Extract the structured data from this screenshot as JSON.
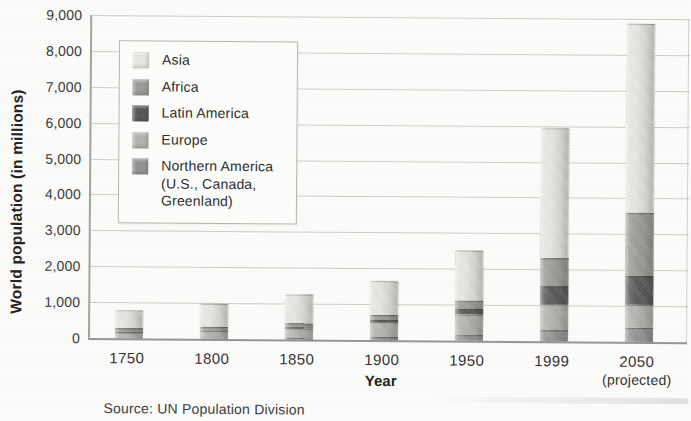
{
  "page": {
    "background": "#fbfbf9"
  },
  "chart_data": {
    "type": "bar",
    "stacked": true,
    "stack_order": "first series renders at top of each bar",
    "title": "",
    "xlabel": "Year",
    "ylabel": "World population (in millions)",
    "source_note": "Source: UN Population Division",
    "categories": [
      "1750",
      "1800",
      "1850",
      "1900",
      "1950",
      "1999",
      "2050"
    ],
    "category_sublabels": [
      "",
      "",
      "",
      "",
      "",
      "",
      "(projected)"
    ],
    "series": [
      {
        "id": "asia",
        "name": "Asia",
        "color": "#e4e4e0",
        "values": [
          502,
          635,
          809,
          947,
          1402,
          3634,
          5268
        ]
      },
      {
        "id": "africa",
        "name": "Africa",
        "color": "#9b9b97",
        "values": [
          106,
          107,
          111,
          133,
          221,
          767,
          1766
        ]
      },
      {
        "id": "latin-america",
        "name": "Latin America",
        "color": "#585856",
        "values": [
          16,
          24,
          38,
          74,
          167,
          511,
          809
        ]
      },
      {
        "id": "europe",
        "name": "Europe",
        "color": "#b2b2ae",
        "values": [
          163,
          203,
          276,
          408,
          547,
          729,
          628
        ]
      },
      {
        "id": "northern-america",
        "name": "Northern America (U.S., Canada, Greenland)",
        "color": "#939391",
        "values": [
          2,
          7,
          26,
          82,
          172,
          307,
          392
        ]
      }
    ],
    "totals_estimated": [
      789,
      976,
      1260,
      1644,
      2509,
      5948,
      8863
    ],
    "ylim": [
      0,
      9000
    ],
    "ytick_step": 1000,
    "yticks": [
      {
        "v": 9000,
        "label": "9,000"
      },
      {
        "v": 8000,
        "label": "8,000"
      },
      {
        "v": 7000,
        "label": "7,000"
      },
      {
        "v": 6000,
        "label": "6,000"
      },
      {
        "v": 5000,
        "label": "5,000"
      },
      {
        "v": 4000,
        "label": "4,000"
      },
      {
        "v": 3000,
        "label": "3,000"
      },
      {
        "v": 2000,
        "label": "2,000"
      },
      {
        "v": 1000,
        "label": "1,000"
      },
      {
        "v": 0,
        "label": "0"
      }
    ],
    "grid": "horizontal",
    "legend": {
      "position": "upper-left inside plot",
      "items": [
        {
          "id": "asia",
          "label_lines": [
            "Asia"
          ]
        },
        {
          "id": "africa",
          "label_lines": [
            "Africa"
          ]
        },
        {
          "id": "latin-america",
          "label_lines": [
            "Latin America"
          ]
        },
        {
          "id": "europe",
          "label_lines": [
            "Europe"
          ]
        },
        {
          "id": "northern-america",
          "label_lines": [
            "Northern America",
            "(U.S., Canada,",
            "Greenland)"
          ]
        }
      ]
    }
  }
}
